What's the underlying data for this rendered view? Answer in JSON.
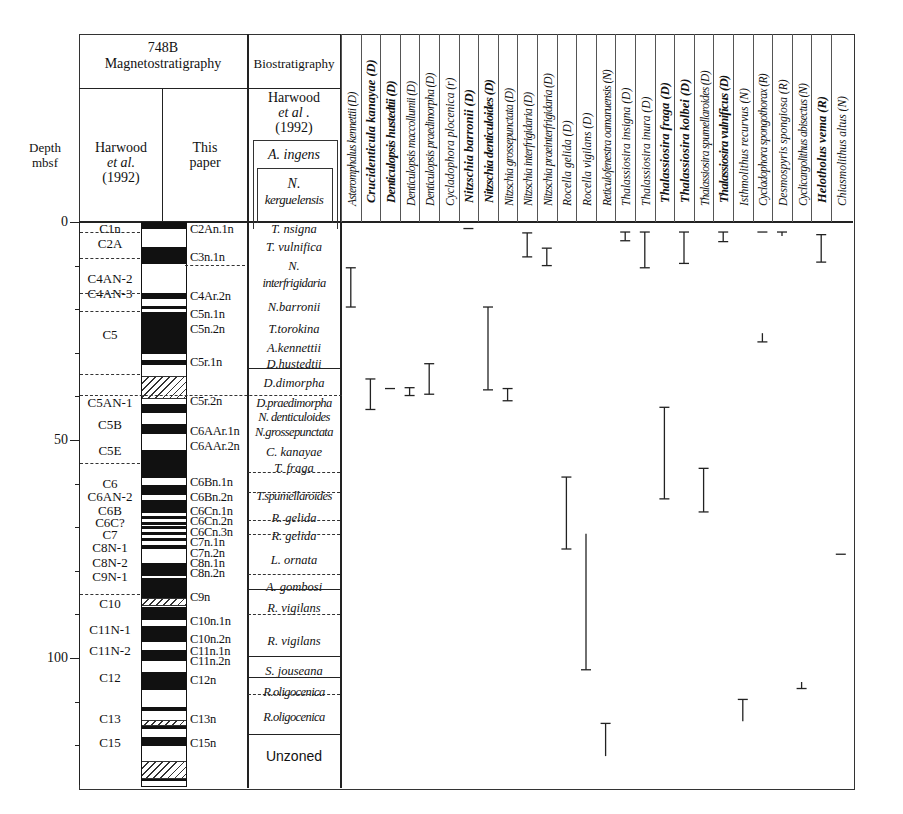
{
  "header": {
    "site": "748B",
    "magneto": "Magnetostratigraphy",
    "bio": "Biostratigraphy",
    "depth_label_1": "Depth",
    "depth_label_2": "mbsf",
    "harwood_1": "Harwood",
    "harwood_2": "et al.",
    "harwood_3": "(1992)",
    "this_1": "This",
    "this_2": "paper",
    "bio_harwood_1": "Harwood",
    "bio_harwood_2": "et al .",
    "bio_harwood_3": "(1992)",
    "bio_top_1": "A. ingens",
    "bio_top_2a": "N.",
    "bio_top_2b": "kerguelensis"
  },
  "depth_axis": {
    "ticks": [
      {
        "value": 0,
        "label": "0"
      },
      {
        "value": 50,
        "label": "50"
      },
      {
        "value": 100,
        "label": "100"
      }
    ],
    "minor_ticks": [
      10,
      20,
      30,
      40,
      60,
      70,
      80,
      90,
      110,
      120
    ]
  },
  "harwood_chrons": [
    {
      "label": "C1n",
      "depth": 1.5
    },
    {
      "label": "C2A",
      "depth": 5
    },
    {
      "label": "C4AN-2",
      "depth": 13
    },
    {
      "label": "C4AN-3",
      "depth": 16.5
    },
    {
      "label": "C5",
      "depth": 26
    },
    {
      "label": "C5AN-1",
      "depth": 41.5
    },
    {
      "label": "C5B",
      "depth": 46.5
    },
    {
      "label": "C5E",
      "depth": 52.5
    },
    {
      "label": "C6",
      "depth": 60
    },
    {
      "label": "C6AN-2",
      "depth": 63
    },
    {
      "label": "C6B",
      "depth": 66.3
    },
    {
      "label": "C6C?",
      "depth": 69
    },
    {
      "label": "C7",
      "depth": 71.8
    },
    {
      "label": "C8N-1",
      "depth": 74.8
    },
    {
      "label": "C8N-2",
      "depth": 78.2
    },
    {
      "label": "C9N-1",
      "depth": 81.5
    },
    {
      "label": "C10",
      "depth": 87.7
    },
    {
      "label": "C11N-1",
      "depth": 93.5
    },
    {
      "label": "C11N-2",
      "depth": 98.5
    },
    {
      "label": "C12",
      "depth": 104.5
    },
    {
      "label": "C13",
      "depth": 114
    },
    {
      "label": "C15",
      "depth": 119.5
    }
  ],
  "this_paper_chrons": [
    {
      "label": "C2An.1n",
      "depth": 1.5
    },
    {
      "label": "C3n.1n",
      "depth": 8
    },
    {
      "label": "C4Ar.2n",
      "depth": 17
    },
    {
      "label": "C5n.1n",
      "depth": 21
    },
    {
      "label": "C5n.2n",
      "depth": 24.5
    },
    {
      "label": "C5r.1n",
      "depth": 32
    },
    {
      "label": "C5r.2n",
      "depth": 41
    },
    {
      "label": "C6AAr.1n",
      "depth": 48
    },
    {
      "label": "C6AAr.2n",
      "depth": 51.3
    },
    {
      "label": "C6Bn.1n",
      "depth": 59.6
    },
    {
      "label": "C6Bn.2n",
      "depth": 63
    },
    {
      "label": "C6Cn.1n",
      "depth": 66.2
    },
    {
      "label": "C6Cn.2n",
      "depth": 68.6
    },
    {
      "label": "C6Cn.3n",
      "depth": 71
    },
    {
      "label": "C7n.1n",
      "depth": 73.5
    },
    {
      "label": "C7n.2n",
      "depth": 76
    },
    {
      "label": "C8n.1n",
      "depth": 78.2
    },
    {
      "label": "C8n.2n",
      "depth": 80.5
    },
    {
      "label": "C9n",
      "depth": 86
    },
    {
      "label": "C10n.1n",
      "depth": 91.5
    },
    {
      "label": "C10n.2n",
      "depth": 95.6
    },
    {
      "label": "C11n.1n",
      "depth": 98.3
    },
    {
      "label": "C11n.2n",
      "depth": 100.8
    },
    {
      "label": "C12n",
      "depth": 105
    },
    {
      "label": "C13n",
      "depth": 114
    },
    {
      "label": "C15n",
      "depth": 119.5
    }
  ],
  "polarity_column": {
    "normal_blocks": [
      [
        0,
        1.3
      ],
      [
        5.5,
        9.5
      ],
      [
        16,
        17.5
      ],
      [
        19,
        19.8
      ],
      [
        20.5,
        30
      ],
      [
        31.5,
        32.5
      ],
      [
        41.5,
        43.5
      ],
      [
        46,
        48.5
      ],
      [
        52,
        58.5
      ],
      [
        60,
        62.5
      ],
      [
        63.5,
        66.5
      ],
      [
        67.3,
        68
      ],
      [
        68.5,
        69.2
      ],
      [
        69.6,
        70.2
      ],
      [
        70.8,
        71.6
      ],
      [
        72.2,
        73
      ],
      [
        73.8,
        74.8
      ],
      [
        78,
        81
      ],
      [
        81.5,
        86
      ],
      [
        88,
        91
      ],
      [
        92.5,
        96
      ],
      [
        98,
        100.5
      ],
      [
        103,
        107
      ],
      [
        111,
        112
      ],
      [
        115,
        116
      ],
      [
        118,
        120
      ],
      [
        127,
        128
      ]
    ],
    "hatched_blocks": [
      [
        35,
        40
      ],
      [
        86,
        87.5
      ],
      [
        114,
        115
      ],
      [
        123.5,
        127
      ]
    ]
  },
  "biozones_right": [
    {
      "label": "T. nsigna",
      "depth": 1.5,
      "italic": true
    },
    {
      "label": "T. vulnifica",
      "depth": 5.8,
      "italic": true
    },
    {
      "label": "N.",
      "depth": 10,
      "italic": true
    },
    {
      "label": "interfrigidaria",
      "depth": 14,
      "italic": true
    },
    {
      "label": "N.barronii",
      "depth": 19.5,
      "italic": true
    },
    {
      "label": "T.torokina",
      "depth": 24.5,
      "italic": true
    },
    {
      "label": "A.kennettii",
      "depth": 29,
      "italic": true
    },
    {
      "label": "D.hustedtii",
      "depth": 32.5,
      "italic": true
    },
    {
      "label": "D.dimorpha",
      "depth": 37,
      "italic": true
    },
    {
      "label": "D.praedimorpha",
      "depth": 41.5,
      "italic": true
    },
    {
      "label": "N. denticuloides",
      "depth": 44.7,
      "italic": true
    },
    {
      "label": "N.grossepunctata",
      "depth": 48.2,
      "italic": true
    },
    {
      "label": "C. kanayae",
      "depth": 52.7,
      "italic": true
    },
    {
      "label": "T. fraga",
      "depth": 56.5,
      "italic": true
    },
    {
      "label": "T.spumellaroides",
      "depth": 62.8,
      "italic": true
    },
    {
      "label": "R. gelida",
      "depth": 67.8,
      "italic": true
    },
    {
      "label": "R. gelida",
      "depth": 72,
      "italic": true
    },
    {
      "label": "L. ornata",
      "depth": 77.5,
      "italic": true
    },
    {
      "label": "A. gombosi",
      "depth": 83.8,
      "italic": true
    },
    {
      "label": "R. vigilans",
      "depth": 88.5,
      "italic": true
    },
    {
      "label": "R. vigilans",
      "depth": 96,
      "italic": true
    },
    {
      "label": "S. jouseana",
      "depth": 103,
      "italic": true
    },
    {
      "label": "R.oligocenica",
      "depth": 107.7,
      "italic": true
    },
    {
      "label": "R.oligocenica",
      "depth": 113.5,
      "italic": true
    },
    {
      "label": "Unzoned",
      "depth": 122.5,
      "italic": false
    }
  ],
  "chart_data": {
    "type": "range",
    "ylabel": "Depth mbsf",
    "ylim": [
      0,
      127
    ],
    "y_inverted": true,
    "categories": [
      "Asteromphalus kennettii (D)",
      "Crucidenticula kanayae (D)",
      "Denticulopsis hustedtii (D)",
      "Denticulopsis maccollumii (D)",
      "Denticulopsis praedimorpha (D)",
      "Cycladophora plocenica (r)",
      "Nitzschia barronii (D)",
      "Nitzschia denticuloides (D)",
      "Nitzschia grossepunctata (D)",
      "Nitzschia interfrigidaria (D)",
      "Nitzschia praeinterfrigidaria (D)",
      "Rocella gelida (D)",
      "Rocella vigilans (D)",
      "Reticulofenestra oamaruensis (N)",
      "Thalassiosira insigna (D)",
      "Thalassiosira inura (D)",
      "Thalassiosira fraga (D)",
      "Thalassiosira kolbei (D)",
      "Thalassiosira spumellaroides (D)",
      "Thalassiosira vulnificus (D)",
      "Isthmolithus recurvus (N)",
      "Cycladophora spongothorax (R)",
      "Desmospyris spongiosa (R)",
      "Cyclicargolithus abisectus (N)",
      "Helotholus vema (R)",
      "Chiasmolithus altus (N)"
    ],
    "bold": [
      false,
      true,
      true,
      false,
      false,
      false,
      true,
      true,
      false,
      false,
      false,
      false,
      false,
      false,
      false,
      false,
      true,
      true,
      false,
      true,
      false,
      false,
      false,
      false,
      true,
      false
    ],
    "ranges": [
      {
        "species": "Asteromphalus kennettii (D)",
        "col": 0,
        "top": 10.5,
        "bottom": 19.5,
        "cap_top": true,
        "cap_bottom": true
      },
      {
        "species": "Crucidenticula kanayae (D)",
        "col": 1,
        "top": 36,
        "bottom": 43,
        "cap_top": true,
        "cap_bottom": true
      },
      {
        "species": "Denticulopsis hustedtii (D)",
        "col": 2,
        "top": 38.2,
        "bottom": 38.2,
        "cap_top": true,
        "cap_bottom": false
      },
      {
        "species": "Denticulopsis maccollumii (D)",
        "col": 3,
        "top": 38,
        "bottom": 39.8,
        "cap_top": true,
        "cap_bottom": true
      },
      {
        "species": "Denticulopsis praedimorpha (D)",
        "col": 4,
        "top": 32.5,
        "bottom": 39.5,
        "cap_top": true,
        "cap_bottom": true
      },
      {
        "species": "Nitzschia barronii (D)",
        "col": 6,
        "top": 1.5,
        "bottom": 1.5,
        "cap_top": true,
        "cap_bottom": false
      },
      {
        "species": "Nitzschia denticuloides (D)",
        "col": 7,
        "top": 19.5,
        "bottom": 38.5,
        "cap_top": true,
        "cap_bottom": true
      },
      {
        "species": "Nitzschia grossepunctata (D)",
        "col": 8,
        "top": 38.2,
        "bottom": 41,
        "cap_top": true,
        "cap_bottom": true
      },
      {
        "species": "Nitzschia interfrigidaria (D)",
        "col": 9,
        "top": 2.5,
        "bottom": 8,
        "cap_top": true,
        "cap_bottom": true
      },
      {
        "species": "Nitzschia praeinterfrigidaria (D)",
        "col": 10,
        "top": 6,
        "bottom": 10,
        "cap_top": true,
        "cap_bottom": true
      },
      {
        "species": "Rocella gelida (D)",
        "col": 11,
        "top": 58.5,
        "bottom": 75,
        "cap_top": true,
        "cap_bottom": true
      },
      {
        "species": "Rocella vigilans (D)",
        "col": 12,
        "top": 71.5,
        "bottom": 102.7,
        "cap_top": false,
        "cap_bottom": true
      },
      {
        "species": "Reticulofenestra oamaruensis (N)",
        "col": 13,
        "top": 115,
        "bottom": 122.5,
        "cap_top": true,
        "cap_bottom": false
      },
      {
        "species": "Thalassiosira insigna (D)",
        "col": 14,
        "top": 2.3,
        "bottom": 4.3,
        "cap_top": true,
        "cap_bottom": true
      },
      {
        "species": "Thalassiosira inura (D)",
        "col": 15,
        "top": 2.3,
        "bottom": 10.5,
        "cap_top": true,
        "cap_bottom": true
      },
      {
        "species": "Thalassiosira fraga (D)",
        "col": 16,
        "top": 42.5,
        "bottom": 63.5,
        "cap_top": true,
        "cap_bottom": true
      },
      {
        "species": "Thalassiosira kolbei (D)",
        "col": 17,
        "top": 2.3,
        "bottom": 9.5,
        "cap_top": true,
        "cap_bottom": true
      },
      {
        "species": "Thalassiosira spumellaroides (D)",
        "col": 18,
        "top": 56.5,
        "bottom": 66.5,
        "cap_top": true,
        "cap_bottom": true
      },
      {
        "species": "Thalassiosira vulnificus (D)",
        "col": 19,
        "top": 2.3,
        "bottom": 4.5,
        "cap_top": true,
        "cap_bottom": true
      },
      {
        "species": "Isthmolithus recurvus (N)",
        "col": 20,
        "top": 109.5,
        "bottom": 114.5,
        "cap_top": true,
        "cap_bottom": false
      },
      {
        "species": "Cycladophora spongothorax (R)",
        "col": 21,
        "top": 2.3,
        "bottom": 2.3,
        "cap_top": true,
        "cap_bottom": false
      },
      {
        "species": "Cycladophora spongothorax (R) base",
        "col": 21,
        "top": 25.5,
        "bottom": 27.5,
        "cap_top": false,
        "cap_bottom": true
      },
      {
        "species": "Desmospyris spongiosa (R)",
        "col": 22,
        "top": 2.3,
        "bottom": 3.2,
        "cap_top": true,
        "cap_bottom": false
      },
      {
        "species": "Cyclicargolithus abisectus (N)",
        "col": 23,
        "top": 105.5,
        "bottom": 107,
        "cap_top": false,
        "cap_bottom": true
      },
      {
        "species": "Helotholus vema (R)",
        "col": 24,
        "top": 2.9,
        "bottom": 9.2,
        "cap_top": true,
        "cap_bottom": true
      },
      {
        "species": "Chiasmolithus altus (N)",
        "col": 25,
        "top": 76.2,
        "bottom": 76.2,
        "cap_top": true,
        "cap_bottom": false
      }
    ]
  }
}
